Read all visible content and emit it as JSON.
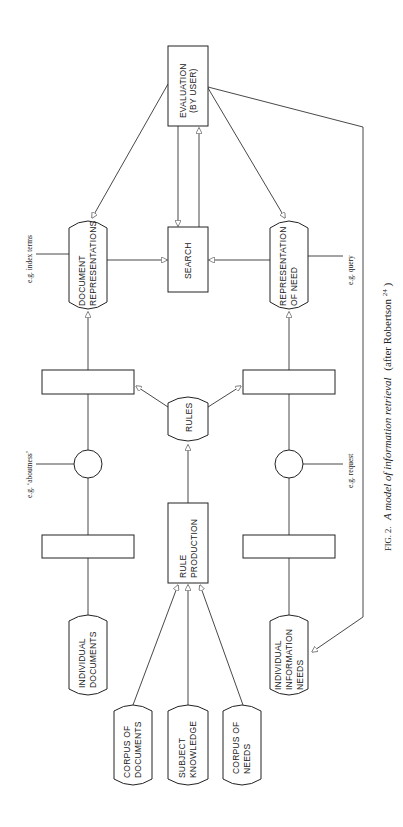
{
  "figure": {
    "caption_prefix": "FIG. 2.",
    "caption_italic": "A model of information retrieval",
    "caption_suffix": "(after Robertson",
    "caption_sup": "24",
    "caption_end": ")"
  },
  "nodes": {
    "evaluation": {
      "line1": "EVALUATION",
      "line2": "(BY USER)"
    },
    "search": {
      "line1": "SEARCH"
    },
    "document_representations": {
      "line1": "DOCUMENT",
      "line2": "REPRESENTATIONS"
    },
    "representation_of_need": {
      "line1": "REPRESENTATION",
      "line2": "OF NEED"
    },
    "rules": {
      "line1": "RULES"
    },
    "rule_production": {
      "line1": "RULE",
      "line2": "PRODUCTION"
    },
    "individual_documents": {
      "line1": "INDIVIDUAL",
      "line2": "DOCUMENTS"
    },
    "individual_information_needs": {
      "line1": "INDIVIDUAL",
      "line2": "INFORMATION",
      "line3": "NEEDS"
    },
    "corpus_of_documents": {
      "line1": "CORPUS OF",
      "line2": "DOCUMENTS"
    },
    "subject_knowledge": {
      "line1": "SUBJECT",
      "line2": "KNOWLEDGE"
    },
    "corpus_of_needs": {
      "line1": "CORPUS OF",
      "line2": "NEEDS"
    }
  },
  "annotations": {
    "index_terms": "e.g. index terms",
    "aboutness": "e.g. ‘aboutness’",
    "query": "e.g. query",
    "request": "e.g. request"
  }
}
